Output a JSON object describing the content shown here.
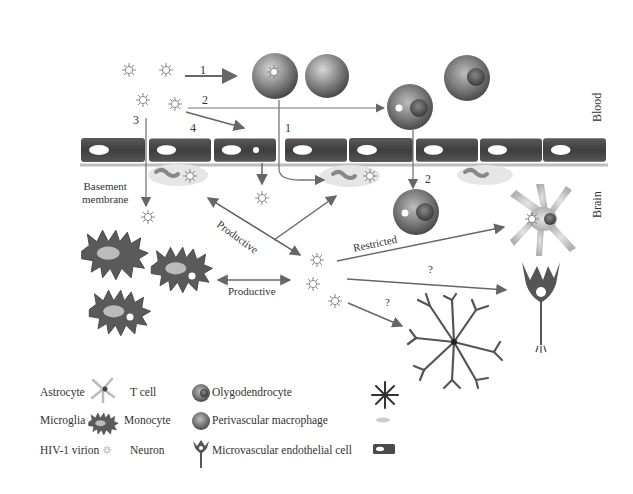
{
  "figure": {
    "compartments": {
      "top": "Blood",
      "bottom": "Brain"
    },
    "structure_labels": {
      "basement_membrane": "Basement membrane",
      "basement_line1": "Basement",
      "basement_line2": "membrane"
    },
    "route_numbers": {
      "route1_top": "1",
      "route2_top": "2",
      "route3": "3",
      "route4": "4",
      "route1_cross": "1",
      "route2_cross": "2"
    },
    "arrow_labels": {
      "productive_diagonal": "Productive",
      "productive_horizontal": "Productive",
      "restricted": "Restricted",
      "unknown_neuron": "?",
      "unknown_oligo": "?"
    }
  },
  "legend": {
    "items": [
      {
        "label": "Astrocyte",
        "icon": "astrocyte-icon"
      },
      {
        "label": "T cell",
        "icon": "t-cell-icon"
      },
      {
        "label": "Olygodendrocyte",
        "icon": "oligodendrocyte-icon"
      },
      {
        "label": "Microglia",
        "icon": "microglia-icon"
      },
      {
        "label": "Monocyte",
        "icon": "monocyte-icon"
      },
      {
        "label": "Perivascular macrophage",
        "icon": "perivascular-macrophage-icon"
      },
      {
        "label": "HIV-1 virion",
        "icon": "hiv-virion-icon"
      },
      {
        "label": "Neuron",
        "icon": "neuron-icon"
      },
      {
        "label": "Microvascular endothelial cell",
        "icon": "endothelial-cell-icon"
      }
    ]
  },
  "colors": {
    "cell_dark": "#4a4a4a",
    "cell_mid": "#7a7a7a",
    "membrane": "#b8b8b8",
    "arrow": "#6a6a6a",
    "background": "#ffffff"
  }
}
